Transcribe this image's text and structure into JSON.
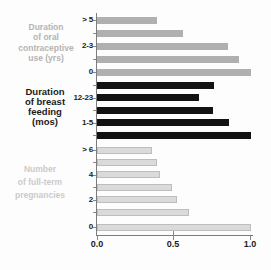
{
  "chart_data": {
    "type": "bar",
    "orientation": "horizontal",
    "title": "",
    "xlabel": "",
    "xlim": [
      0.0,
      1.0
    ],
    "x_tick_labels": [
      "0.0",
      "0.5",
      "1.0"
    ],
    "x_tick_values": [
      0.0,
      0.5,
      1.0
    ],
    "grid": false,
    "legend": false,
    "groups": [
      {
        "name": "Duration of oral contraceptive use (yrs)",
        "label_lines": [
          "Duration",
          "of oral",
          "contraceptive",
          "use (yrs)"
        ],
        "label_color": "#b4b4b4",
        "bar_color": "#b0b0b0",
        "categories": [
          "> 5",
          "",
          "2-3",
          "",
          "0"
        ],
        "values": [
          0.39,
          0.56,
          0.85,
          0.92,
          1.0
        ]
      },
      {
        "name": "Duration of breast feeding (mos)",
        "label_lines": [
          "Duration",
          "of breast",
          "feeding",
          "(mos)"
        ],
        "label_color": "#1a1a1a",
        "bar_color": "#121212",
        "categories": [
          "",
          "12-23",
          "",
          "1-5",
          ""
        ],
        "values": [
          0.76,
          0.66,
          0.75,
          0.86,
          1.0
        ]
      },
      {
        "name": "Number of full-term pregnancies",
        "label_lines": [
          "Number",
          "of full-term",
          "pregnancies"
        ],
        "label_color": "#cbcbcb",
        "bar_color": "#dadada",
        "bar_border": "#bdbdbd",
        "categories": [
          "> 6",
          "",
          "4",
          "",
          "2",
          "",
          "0"
        ],
        "values": [
          0.36,
          0.39,
          0.41,
          0.49,
          0.52,
          0.6,
          1.0
        ]
      }
    ]
  }
}
